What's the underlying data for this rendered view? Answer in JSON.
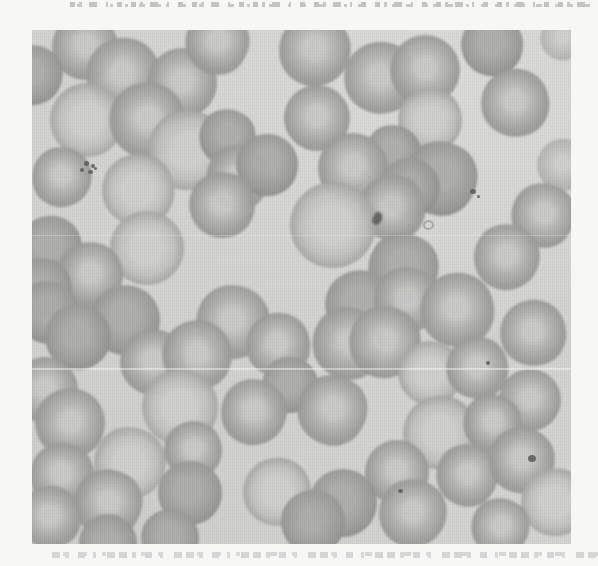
{
  "figure": {
    "kind": "scanned photomicrograph",
    "photo_rect": {
      "left": 32,
      "top": 30,
      "width": 539,
      "height": 514
    },
    "palette": {
      "page_background": "#f7f7f5",
      "photo_background": "#d3d3d1",
      "cell_rim": "#969694",
      "cell_body": "#a8a8a6",
      "cell_pale_center": "#c9c9c7",
      "debris_dark": "#555553"
    }
  },
  "cropped_text": {
    "top_line": "illegible — only bottom edges of a cut-off text line are visible",
    "bottom_line": "illegible — only top edges of a cut-off caption line are visible"
  },
  "specimen": {
    "cell_types": {
      "r": "ring (darker rim, light center)",
      "p": "pale large center",
      "d": "darker dense cell"
    },
    "cells": [
      [
        53,
        17,
        66,
        "r"
      ],
      [
        1,
        45,
        60,
        "d"
      ],
      [
        91,
        45,
        74,
        "r"
      ],
      [
        150,
        53,
        70,
        "r"
      ],
      [
        185,
        12,
        64,
        "r"
      ],
      [
        283,
        20,
        72,
        "r"
      ],
      [
        348,
        48,
        72,
        "r"
      ],
      [
        393,
        40,
        70,
        "r"
      ],
      [
        460,
        15,
        62,
        "d"
      ],
      [
        530,
        8,
        44,
        "r",
        0.55
      ],
      [
        483,
        73,
        68,
        "r"
      ],
      [
        55,
        90,
        74,
        "p"
      ],
      [
        115,
        90,
        76,
        "r"
      ],
      [
        156,
        120,
        80,
        "p"
      ],
      [
        195,
        107,
        56,
        "d"
      ],
      [
        285,
        88,
        66,
        "r"
      ],
      [
        398,
        90,
        64,
        "p"
      ],
      [
        361,
        123,
        56,
        "d"
      ],
      [
        531,
        135,
        52,
        "r",
        0.6
      ],
      [
        206,
        147,
        64,
        "r"
      ],
      [
        235,
        135,
        62,
        "d"
      ],
      [
        30,
        147,
        60,
        "r"
      ],
      [
        106,
        160,
        72,
        "p"
      ],
      [
        321,
        138,
        70,
        "r"
      ],
      [
        408,
        148,
        74,
        "d"
      ],
      [
        378,
        158,
        60,
        "d"
      ],
      [
        360,
        178,
        66,
        "r"
      ],
      [
        301,
        195,
        86,
        "p"
      ],
      [
        190,
        175,
        66,
        "r"
      ],
      [
        511,
        185,
        64,
        "r"
      ],
      [
        18,
        218,
        64,
        "d"
      ],
      [
        115,
        218,
        74,
        "p"
      ],
      [
        58,
        245,
        66,
        "r"
      ],
      [
        475,
        227,
        66,
        "r"
      ],
      [
        371,
        238,
        70,
        "d"
      ],
      [
        10,
        258,
        60,
        "d"
      ],
      [
        328,
        275,
        70,
        "d"
      ],
      [
        375,
        270,
        66,
        "r"
      ],
      [
        425,
        280,
        74,
        "r"
      ],
      [
        15,
        282,
        62,
        "d"
      ],
      [
        93,
        290,
        70,
        "d"
      ],
      [
        201,
        292,
        74,
        "r"
      ],
      [
        501,
        303,
        66,
        "r"
      ],
      [
        46,
        307,
        66,
        "d"
      ],
      [
        316,
        313,
        72,
        "r"
      ],
      [
        353,
        312,
        72,
        "r"
      ],
      [
        246,
        315,
        64,
        "r"
      ],
      [
        121,
        332,
        66,
        "r"
      ],
      [
        165,
        325,
        70,
        "r"
      ],
      [
        398,
        343,
        64,
        "p"
      ],
      [
        445,
        338,
        62,
        "r"
      ],
      [
        13,
        360,
        66,
        "r"
      ],
      [
        148,
        377,
        76,
        "p"
      ],
      [
        258,
        355,
        56,
        "d"
      ],
      [
        300,
        380,
        70,
        "r"
      ],
      [
        498,
        370,
        62,
        "r"
      ],
      [
        38,
        393,
        70,
        "r"
      ],
      [
        222,
        382,
        66,
        "r"
      ],
      [
        408,
        403,
        74,
        "p"
      ],
      [
        460,
        393,
        58,
        "r"
      ],
      [
        161,
        420,
        58,
        "r"
      ],
      [
        98,
        433,
        72,
        "p"
      ],
      [
        30,
        445,
        64,
        "r"
      ],
      [
        365,
        442,
        64,
        "r"
      ],
      [
        435,
        445,
        62,
        "r"
      ],
      [
        490,
        430,
        66,
        "r"
      ],
      [
        245,
        462,
        68,
        "p"
      ],
      [
        158,
        463,
        64,
        "d"
      ],
      [
        523,
        472,
        68,
        "p"
      ],
      [
        76,
        473,
        68,
        "r"
      ],
      [
        18,
        487,
        62,
        "r"
      ],
      [
        311,
        473,
        68,
        "d"
      ],
      [
        281,
        492,
        64,
        "d"
      ],
      [
        381,
        483,
        68,
        "r"
      ],
      [
        468,
        497,
        58,
        "r"
      ],
      [
        76,
        513,
        58,
        "d"
      ],
      [
        138,
        508,
        58,
        "d"
      ]
    ],
    "debris": [
      [
        52,
        131,
        5,
        5,
        "dot"
      ],
      [
        59,
        134,
        4,
        4,
        "dot"
      ],
      [
        48,
        138,
        4,
        4,
        "dot"
      ],
      [
        56,
        140,
        5,
        4,
        "dot"
      ],
      [
        62,
        137,
        3,
        3,
        "dot"
      ],
      [
        438,
        159,
        6,
        5,
        "dot"
      ],
      [
        445,
        165,
        3,
        3,
        "dot"
      ],
      [
        341,
        182,
        9,
        13,
        "smudge"
      ],
      [
        391,
        190,
        11,
        10,
        "ring"
      ],
      [
        496,
        425,
        8,
        7,
        "dot"
      ],
      [
        366,
        459,
        5,
        4,
        "dot"
      ],
      [
        454,
        331,
        4,
        4,
        "dot"
      ]
    ],
    "scanline_artifacts": [
      {
        "y": 205,
        "height": 1,
        "opacity": 0.25
      },
      {
        "y": 338,
        "height": 2,
        "opacity": 0.45
      }
    ]
  }
}
